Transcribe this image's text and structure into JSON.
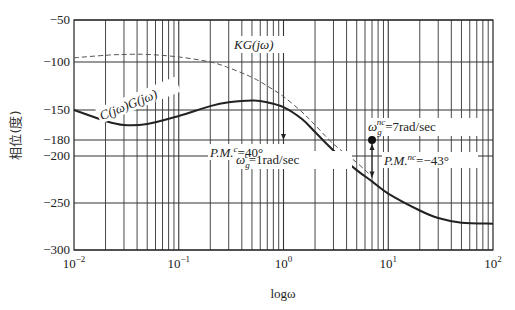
{
  "chart_data": {
    "type": "line",
    "title": "",
    "xlabel": "logω",
    "ylabel": "相位(度)",
    "xscale": "log",
    "xlim": [
      0.01,
      100
    ],
    "ylim": [
      -300,
      -50
    ],
    "grid": true,
    "x_tick_labels": [
      "10^-2",
      "10^-1",
      "10^0",
      "10^1",
      "10^2"
    ],
    "y_ticks": [
      -50,
      -100,
      -150,
      -180,
      -200,
      -250,
      -300
    ],
    "series": [
      {
        "name": "C(jω)G(jω)",
        "style": "solid",
        "x": [
          0.01,
          0.02,
          0.03,
          0.05,
          0.1,
          0.2,
          0.3,
          0.5,
          0.7,
          1,
          1.5,
          2,
          3,
          5,
          7,
          10,
          20,
          30,
          50,
          100
        ],
        "y": [
          -150,
          -161,
          -165,
          -164,
          -156,
          -146,
          -142,
          -140,
          -142,
          -147,
          -159,
          -172,
          -193,
          -215,
          -227,
          -240,
          -258,
          -266,
          -271,
          -272
        ]
      },
      {
        "name": "KG(jω)",
        "style": "dashed",
        "x": [
          0.01,
          0.02,
          0.03,
          0.05,
          0.1,
          0.2,
          0.3,
          0.5,
          0.7,
          1,
          1.5,
          2,
          3,
          5,
          7
        ],
        "y": [
          -95,
          -92,
          -91,
          -91,
          -94,
          -100,
          -106,
          -116,
          -125,
          -136,
          -152,
          -165,
          -185,
          -207,
          -222
        ]
      }
    ],
    "annotations": [
      {
        "text_main": "P.M.",
        "sup": "c",
        "text_after": "=40°",
        "x": 1,
        "y_from": -140,
        "y_to": -180
      },
      {
        "text_main": "ω",
        "sub": "g",
        "sup": "c",
        "text_after": "=1rad/sec",
        "x": 1,
        "y": -180
      },
      {
        "text_main": "ω",
        "sub": "g",
        "sup": "nc",
        "text_after": "=7rad/sec",
        "x": 7,
        "y": -180
      },
      {
        "text_main": "P.M.",
        "sup": "nc",
        "text_after": "=−43°",
        "x": 7,
        "y_from": -180,
        "y_to": -223
      }
    ],
    "curve_labels": [
      "C(jω)G(jω)",
      "KG(jω)"
    ]
  },
  "labels": {
    "xlabel": "logω",
    "ylabel": "相位(度)",
    "kg": "KG(jω)",
    "cg": "C(jω)G(jω)",
    "pmc_main": "P.M.",
    "pmc_sup": "c",
    "pmc_val": "=40°",
    "wgc_main": "ω",
    "wgc_sub": "g",
    "wgc_sup": "c",
    "wgc_val": "=1rad/sec",
    "wgnc_main": "ω",
    "wgnc_sub": "g",
    "wgnc_sup": "nc",
    "wgnc_val": "=7rad/sec",
    "pmnc_main": "P.M.",
    "pmnc_sup": "nc",
    "pmnc_val": "=−43°",
    "yticks": [
      "−50",
      "−100",
      "−150",
      "−180",
      "−200",
      "−250",
      "−300"
    ],
    "xticks_base": [
      "10",
      "10",
      "10",
      "10",
      "10"
    ],
    "xticks_exp": [
      "−2",
      "−1",
      "0",
      "1",
      "2"
    ]
  }
}
